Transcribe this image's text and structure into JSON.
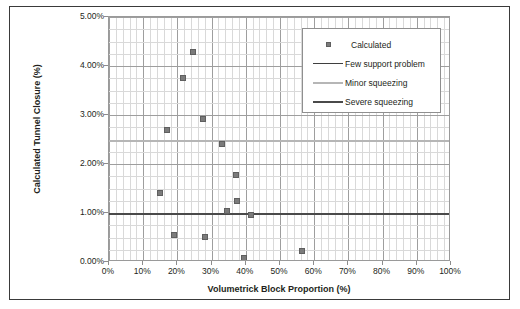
{
  "chart_data": {
    "type": "scatter",
    "title": "",
    "xlabel": "Volumetrick Block Proportion (%)",
    "ylabel": "Calculated Tunnel Closure (%)",
    "xlim": [
      0,
      100
    ],
    "ylim": [
      0,
      5
    ],
    "grid": true,
    "x_tick_labels": [
      "0%",
      "10%",
      "20%",
      "30%",
      "40%",
      "50%",
      "60%",
      "70%",
      "80%",
      "90%",
      "100%"
    ],
    "x_tick_values": [
      0,
      10,
      20,
      30,
      40,
      50,
      60,
      70,
      80,
      90,
      100
    ],
    "y_tick_labels": [
      "0.00%",
      "1.00%",
      "2.00%",
      "3.00%",
      "4.00%",
      "5.00%"
    ],
    "y_tick_values": [
      0,
      1,
      2,
      3,
      4,
      5
    ],
    "x_minor_step": 2,
    "y_minor_step": 0.25,
    "legend_position": "upper-right",
    "series": [
      {
        "name": "Calculated",
        "type": "scatter",
        "marker": "square",
        "color": "#7b7b7b",
        "points": [
          {
            "x": 15.0,
            "y": 1.4
          },
          {
            "x": 17.0,
            "y": 2.7
          },
          {
            "x": 19.0,
            "y": 0.55
          },
          {
            "x": 21.5,
            "y": 3.75
          },
          {
            "x": 24.5,
            "y": 4.28
          },
          {
            "x": 27.5,
            "y": 2.92
          },
          {
            "x": 28.0,
            "y": 0.52
          },
          {
            "x": 33.0,
            "y": 2.4
          },
          {
            "x": 34.5,
            "y": 1.05
          },
          {
            "x": 37.0,
            "y": 1.77
          },
          {
            "x": 37.5,
            "y": 1.25
          },
          {
            "x": 39.5,
            "y": 0.08
          },
          {
            "x": 41.5,
            "y": 0.95
          },
          {
            "x": 56.5,
            "y": 0.22
          }
        ]
      },
      {
        "name": "Few support problem",
        "type": "hline",
        "color": "#3f3f3f",
        "value": 1.0
      },
      {
        "name": "Minor squeezing",
        "type": "hline",
        "color": "#b6b6b6",
        "value": 2.5
      },
      {
        "name": "Severe squeezing",
        "type": "hline",
        "color": "#4a4a4a",
        "value": 1.0
      }
    ],
    "legend_entries": [
      {
        "label": "Calculated",
        "key": "square-marker",
        "color": "#7b7b7b"
      },
      {
        "label": "Few support problem",
        "key": "thin-line",
        "color": "#3f3f3f"
      },
      {
        "label": "Minor squeezing",
        "key": "light-line",
        "color": "#b6b6b6"
      },
      {
        "label": "Severe squeezing",
        "key": "thick-line",
        "color": "#4a4a4a"
      }
    ]
  }
}
